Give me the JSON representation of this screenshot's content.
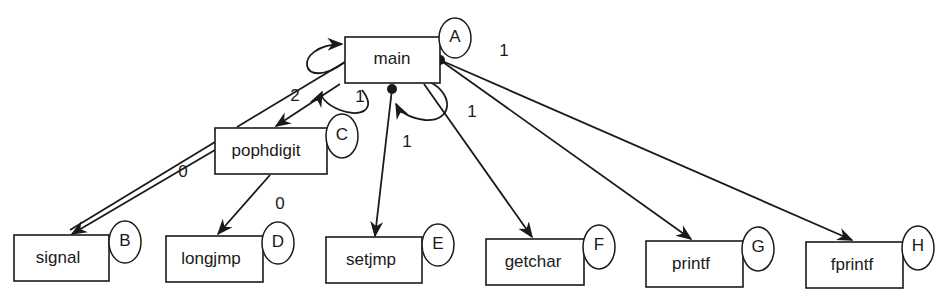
{
  "diagram": {
    "type": "call-graph",
    "nodes": [
      {
        "id": "A",
        "label": "main",
        "tag": "A",
        "x": 345,
        "y": 37,
        "w": 95,
        "h": 46
      },
      {
        "id": "B",
        "label": "signal",
        "tag": "B",
        "x": 14,
        "y": 235,
        "w": 95,
        "h": 46
      },
      {
        "id": "C",
        "label": "pophdigit",
        "tag": "C",
        "x": 215,
        "y": 128,
        "w": 112,
        "h": 46
      },
      {
        "id": "D",
        "label": "longjmp",
        "tag": "D",
        "x": 166,
        "y": 236,
        "w": 97,
        "h": 46
      },
      {
        "id": "E",
        "label": "setjmp",
        "tag": "E",
        "x": 326,
        "y": 237,
        "w": 96,
        "h": 46
      },
      {
        "id": "F",
        "label": "getchar",
        "tag": "F",
        "x": 486,
        "y": 239,
        "w": 98,
        "h": 46
      },
      {
        "id": "G",
        "label": "printf",
        "tag": "G",
        "x": 646,
        "y": 241,
        "w": 97,
        "h": 46
      },
      {
        "id": "H",
        "label": "fprintf",
        "tag": "H",
        "x": 806,
        "y": 242,
        "w": 97,
        "h": 46
      }
    ],
    "edges": [
      {
        "from": "main",
        "to": "main",
        "label": "",
        "kind": "self-loop-left"
      },
      {
        "from": "main",
        "to": "pophdigit",
        "label": "1"
      },
      {
        "from": "main",
        "to": "signal",
        "label": "2",
        "via": "pophdigit-corner"
      },
      {
        "from": "pophdigit",
        "to": "signal",
        "label": "0",
        "kind": "double-line"
      },
      {
        "from": "pophdigit",
        "to": "longjmp",
        "label": "0"
      },
      {
        "from": "main",
        "to": "setjmp",
        "label": "1",
        "kind": "from-dot"
      },
      {
        "from": "main",
        "to": "main",
        "label": "1",
        "kind": "self-loop-bottom"
      },
      {
        "from": "main",
        "to": "getchar",
        "label": "1"
      },
      {
        "from": "main",
        "to": "printf",
        "label": "",
        "kind": "from-dot"
      },
      {
        "from": "main",
        "to": "fprintf",
        "label": "1",
        "kind": "from-dot"
      }
    ],
    "labels": {
      "edge_main_right": "1",
      "edge_main_pophdigit": "1",
      "edge_main_signal": "2",
      "edge_pophdigit_signal": "0",
      "edge_pophdigit_longjmp": "0",
      "edge_main_setjmp": "1",
      "edge_main_getchar": "1"
    }
  }
}
